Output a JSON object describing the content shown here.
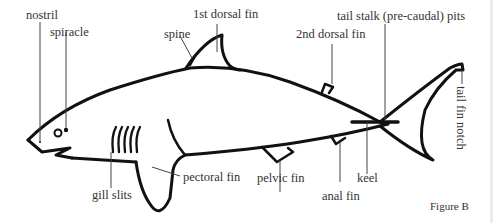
{
  "figure": {
    "caption": "Figure B",
    "colors": {
      "outline": "#111111",
      "leader": "#444444",
      "background": "#ffffff"
    }
  },
  "labels": {
    "nostril": "nostril",
    "spiracle": "spiracle",
    "spine": "spine",
    "first_dorsal_fin": "1st dorsal fin",
    "second_dorsal_fin": "2nd dorsal fin",
    "tail_stalk_pits": "tail stalk (pre-caudal) pits",
    "tail_fin_notch": "tail fin notch",
    "gill_slits": "gill slits",
    "pectoral_fin": "pectoral fin",
    "pelvic_fin": "pelvic fin",
    "anal_fin": "anal fin",
    "keel": "keel"
  }
}
